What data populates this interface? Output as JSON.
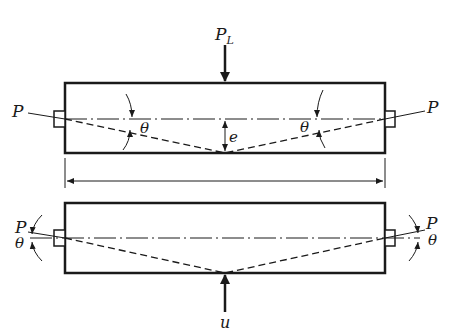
{
  "diagram": {
    "type": "beam-prestress-load-balancing",
    "top_panel": {
      "load_label": "P",
      "load_subscript": "L",
      "left_force_label": "P",
      "right_force_label": "P",
      "left_angle_label": "θ",
      "right_angle_label": "θ",
      "eccentricity_label": "e"
    },
    "span_dimension": {
      "label": ""
    },
    "bottom_panel": {
      "left_force_label": "P",
      "right_force_label": "P",
      "left_angle_label": "θ",
      "right_angle_label": "θ",
      "upward_force_label": "u"
    },
    "colors": {
      "stroke": "#1a1a1a",
      "background": "#ffffff"
    }
  }
}
